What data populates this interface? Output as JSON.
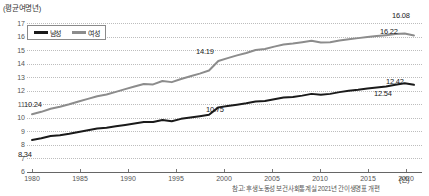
{
  "chart_data": {
    "type": "line",
    "title": "",
    "ylabel": "(평균여명년)",
    "xlabel": "(년)",
    "ylim": [
      6,
      17
    ],
    "xlim": [
      1980,
      2021
    ],
    "yticks": [
      "6",
      "7",
      "8",
      "9",
      "10",
      "11",
      "12",
      "13",
      "14",
      "15",
      "16",
      "17"
    ],
    "xticks": [
      "1980",
      "1985",
      "1990",
      "1995",
      "2000",
      "2005",
      "2010",
      "2015",
      "2020"
    ],
    "grid": true,
    "legend_position": "top-left",
    "series": [
      {
        "name": "남성",
        "color": "#1a1a1a",
        "x": [
          1980,
          1981,
          1982,
          1983,
          1984,
          1985,
          1986,
          1987,
          1988,
          1989,
          1990,
          1991,
          1992,
          1993,
          1994,
          1995,
          1996,
          1997,
          1998,
          1999,
          2000,
          2001,
          2002,
          2003,
          2004,
          2005,
          2006,
          2007,
          2008,
          2009,
          2010,
          2011,
          2012,
          2013,
          2014,
          2015,
          2016,
          2017,
          2018,
          2019,
          2020,
          2021
        ],
        "values": [
          8.34,
          8.46,
          8.63,
          8.69,
          8.8,
          8.93,
          9.05,
          9.18,
          9.24,
          9.35,
          9.45,
          9.55,
          9.66,
          9.66,
          9.81,
          9.72,
          9.9,
          10.0,
          10.1,
          10.2,
          10.75,
          10.85,
          10.95,
          11.05,
          11.18,
          11.22,
          11.35,
          11.48,
          11.52,
          11.62,
          11.75,
          11.68,
          11.75,
          11.88,
          11.98,
          12.05,
          12.15,
          12.22,
          12.3,
          12.42,
          12.54,
          12.42
        ],
        "labels": [
          {
            "x": 1980,
            "value": 8.34,
            "text": "8.34"
          },
          {
            "x": 2000,
            "value": 10.75,
            "text": "10.75"
          },
          {
            "x": 2020,
            "value": 12.54,
            "text": "12.54"
          },
          {
            "x": 2021,
            "value": 12.42,
            "text": "12.42"
          }
        ]
      },
      {
        "name": "여성",
        "color": "#8c8c8c",
        "x": [
          1980,
          1981,
          1982,
          1983,
          1984,
          1985,
          1986,
          1987,
          1988,
          1989,
          1990,
          1991,
          1992,
          1993,
          1994,
          1995,
          1996,
          1997,
          1998,
          1999,
          2000,
          2001,
          2002,
          2003,
          2004,
          2005,
          2006,
          2007,
          2008,
          2009,
          2010,
          2011,
          2012,
          2013,
          2014,
          2015,
          2016,
          2017,
          2018,
          2019,
          2020,
          2021
        ],
        "values": [
          10.24,
          10.42,
          10.65,
          10.8,
          10.98,
          11.18,
          11.38,
          11.58,
          11.7,
          11.9,
          12.1,
          12.3,
          12.48,
          12.45,
          12.7,
          12.62,
          12.85,
          13.05,
          13.25,
          13.48,
          14.19,
          14.4,
          14.6,
          14.78,
          15.0,
          15.08,
          15.25,
          15.4,
          15.48,
          15.58,
          15.68,
          15.55,
          15.58,
          15.7,
          15.8,
          15.88,
          15.96,
          16.03,
          16.1,
          16.18,
          16.22,
          16.08
        ],
        "labels": [
          {
            "x": 1980,
            "value": 10.24,
            "text": "10.24"
          },
          {
            "x": 2000,
            "value": 14.19,
            "text": "14.19"
          },
          {
            "x": 2020,
            "value": 16.22,
            "text": "16.22"
          },
          {
            "x": 2021,
            "value": 16.08,
            "text": "16.08"
          }
        ]
      }
    ],
    "footnote": "참고: 후생노동성 보건사회통계실 2021년 간이생명표 개편"
  },
  "legend": {
    "male_label": "남성",
    "female_label": "여성"
  },
  "colors": {
    "male": "#1a1a1a",
    "female": "#8c8c8c",
    "grid": "#bdbdbd",
    "axis": "#666666",
    "background": "#ffffff"
  },
  "labels": {
    "l_8_34": "8.34",
    "l_10_24": "10.24",
    "l_10_75": "10.75",
    "l_14_19": "14.19",
    "l_12_42": "12.42",
    "l_12_54": "12.54",
    "l_16_08": "16.08",
    "l_16_22": "16.22"
  },
  "axis": {
    "y_unit": "(평균여명년)",
    "x_unit": "(년)",
    "y_6": "6",
    "y_7": "7",
    "y_8": "8",
    "y_9": "9",
    "y_10": "10",
    "y_11": "11",
    "y_12": "12",
    "y_13": "13",
    "y_14": "14",
    "y_15": "15",
    "y_16": "16",
    "y_17": "17",
    "x_1980": "1980",
    "x_1985": "1985",
    "x_1990": "1990",
    "x_1995": "1995",
    "x_2000": "2000",
    "x_2005": "2005",
    "x_2010": "2010",
    "x_2015": "2015",
    "x_2020": "2020"
  },
  "footnote": "참고: 후생노동성 보건사회통계실 2021년 간이생명표 개편"
}
